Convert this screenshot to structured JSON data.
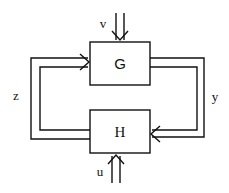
{
  "diagram": {
    "blocks": [
      {
        "id": "G",
        "label": "G"
      },
      {
        "id": "H",
        "label": "H"
      }
    ],
    "signals": {
      "v": "v",
      "u": "u",
      "z": "z",
      "y": "y"
    },
    "colors": {
      "stroke": "#111111",
      "background": "#ffffff"
    }
  }
}
